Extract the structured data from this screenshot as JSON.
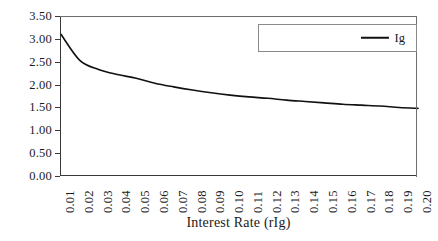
{
  "chart_data": {
    "type": "line",
    "title": "",
    "xlabel": "Interest Rate (rIg)",
    "ylabel": "",
    "xlim": [
      0.01,
      0.2
    ],
    "ylim": [
      0.0,
      3.5
    ],
    "grid": false,
    "legend_position": "top-right",
    "series": [
      {
        "name": "Ig",
        "color": "#111111",
        "x": [
          0.01,
          0.02,
          0.03,
          0.04,
          0.05,
          0.06,
          0.07,
          0.08,
          0.09,
          0.1,
          0.11,
          0.12,
          0.13,
          0.14,
          0.15,
          0.16,
          0.17,
          0.18,
          0.19,
          0.2
        ],
        "values": [
          3.1,
          2.53,
          2.33,
          2.22,
          2.14,
          2.03,
          1.95,
          1.88,
          1.82,
          1.77,
          1.73,
          1.7,
          1.66,
          1.63,
          1.6,
          1.57,
          1.55,
          1.53,
          1.5,
          1.48
        ]
      }
    ],
    "x_tick_labels": [
      "0.01",
      "0.02",
      "0.03",
      "0.04",
      "0.05",
      "0.06",
      "0.07",
      "0.08",
      "0.09",
      "0.10",
      "0.11",
      "0.12",
      "0.13",
      "0.14",
      "0.15",
      "0.16",
      "0.17",
      "0.18",
      "0.19",
      "0.20"
    ],
    "y_tick_labels": [
      "0.00",
      "0.50",
      "1.00",
      "1.50",
      "2.00",
      "2.50",
      "3.00",
      "3.50"
    ],
    "y_tick_values": [
      0.0,
      0.5,
      1.0,
      1.5,
      2.0,
      2.5,
      3.0,
      3.5
    ],
    "legend": [
      {
        "label": "Ig",
        "color": "#111111",
        "marker": "line"
      }
    ]
  },
  "axes": {
    "x_title": "Interest Rate (rIg)"
  },
  "colors": {
    "series_line": "#111111",
    "axis_line": "#3a3a3a",
    "frame_line": "#6e6e6e",
    "legend_border": "#8a8a8a",
    "background": "#ffffff",
    "text": "#1a1a1a"
  }
}
